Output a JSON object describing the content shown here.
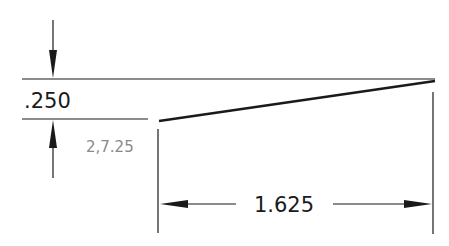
{
  "drawing": {
    "vertical_dimension": {
      "label": ".250",
      "color": "#1a1a1a"
    },
    "horizontal_dimension": {
      "label": "1.625",
      "color": "#1a1a1a"
    },
    "coordinate_note": {
      "label": "2,7.25",
      "color": "#8a8a8a"
    },
    "line_color": "#1a1a1a"
  }
}
